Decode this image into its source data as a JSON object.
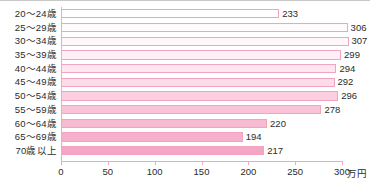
{
  "chart_data": {
    "type": "bar",
    "orientation": "horizontal",
    "title": "",
    "xlabel": "万円",
    "ylabel": "",
    "xlim": [
      0,
      300
    ],
    "grid": false,
    "legend": null,
    "categories": [
      "20〜24歳",
      "25〜29歳",
      "30〜34歳",
      "35〜39歳",
      "40〜44歳",
      "45〜49歳",
      "50〜54歳",
      "55〜59歳",
      "60〜64歳",
      "65〜69歳",
      "70歳以上"
    ],
    "values": [
      233,
      306,
      307,
      299,
      294,
      292,
      296,
      278,
      220,
      194,
      217
    ],
    "value_labels": [
      "233",
      "306",
      "307",
      "299",
      "294",
      "292",
      "296",
      "278",
      "220",
      "194",
      "217"
    ],
    "bar_colors": [
      "#fffdfe",
      "#fffafc",
      "#fef6f9",
      "#fdeff5",
      "#fce6ef",
      "#fbdce8",
      "#fad0e0",
      "#f9c4d8",
      "#f8bad1",
      "#f7b0cb",
      "#f6a6c5"
    ],
    "bar_border_color": "#f2a3bf",
    "axis_color": "#f3a7c2",
    "x_ticks": [
      0,
      50,
      100,
      150,
      200,
      250,
      300
    ],
    "x_tick_labels": [
      "0",
      "50",
      "100",
      "150",
      "200",
      "250",
      "300"
    ],
    "unit_label": "万円"
  },
  "footer": {
    "clipped_note": ""
  }
}
